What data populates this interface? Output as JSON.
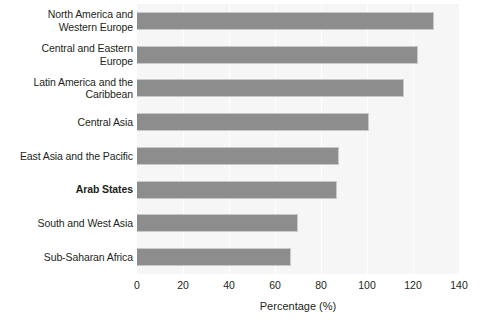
{
  "chart_data": {
    "type": "bar",
    "orientation": "horizontal",
    "title": "",
    "xlabel": "Percentage (%)",
    "ylabel": "",
    "xlim": [
      0,
      140
    ],
    "xticks": [
      0,
      20,
      40,
      60,
      80,
      100,
      120,
      140
    ],
    "grid": true,
    "grid_axis": "x",
    "legend": "none",
    "categories": [
      "North America and Western Europe",
      "Central and Eastern Europe",
      "Latin America and the Caribbean",
      "Central Asia",
      "East Asia and the Pacific",
      "Arab States",
      "South and West Asia",
      "Sub-Saharan Africa"
    ],
    "category_lines": [
      [
        "North America and",
        "Western Europe"
      ],
      [
        "Central and Eastern",
        "Europe"
      ],
      [
        "Latin America and the",
        "Caribbean"
      ],
      [
        "Central Asia"
      ],
      [
        "East Asia and the Pacific"
      ],
      [
        "Arab States"
      ],
      [
        "South and West Asia"
      ],
      [
        "Sub-Saharan Africa"
      ]
    ],
    "values": [
      129,
      122,
      116,
      101,
      88,
      87,
      70,
      67
    ],
    "highlighted_category": "Arab States",
    "colors": {
      "bar": "#8d8d8d",
      "bar_border": "#c9c9c9",
      "plot_background": "#f6f6f6",
      "gridline": "#ffffff",
      "text": "#231f20",
      "page_background": "#ffffff"
    }
  }
}
